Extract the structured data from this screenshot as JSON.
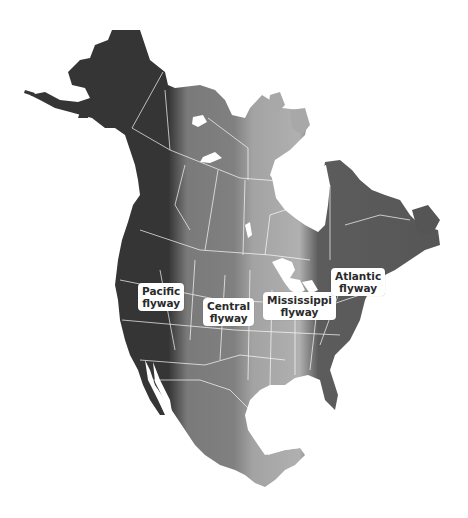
{
  "map": {
    "title": "North American Flyways",
    "colors": {
      "pacific": "#3a3a3a",
      "central": "#7c7c7c",
      "mississippi": "#a8a8a8",
      "atlantic": "#5a5a5a",
      "borders": "#ffffff",
      "background": "#ffffff"
    },
    "flyways": [
      {
        "id": "pacific",
        "line1": "Pacific",
        "line2": "flyway"
      },
      {
        "id": "central",
        "line1": "Central",
        "line2": "flyway"
      },
      {
        "id": "mississippi",
        "line1": "Mississippi",
        "line2": "flyway"
      },
      {
        "id": "atlantic",
        "line1": "Atlantic",
        "line2": "flyway"
      }
    ]
  }
}
